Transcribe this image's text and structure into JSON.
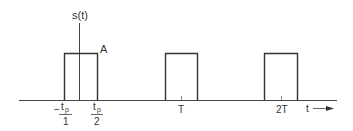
{
  "diagram": {
    "y_axis_label": "s(t)",
    "amplitude_label": "A",
    "x_axis_label": "t",
    "tick_labels": {
      "neg_half_width_num": "t",
      "neg_half_width_sub": "p",
      "neg_half_width_den": "1",
      "neg_sign": "−",
      "pos_half_width_num": "t",
      "pos_half_width_sub": "p",
      "pos_half_width_den": "2",
      "period": "T",
      "two_period": "2T"
    },
    "pulses": [
      {
        "center": "0",
        "label": "pulse-0"
      },
      {
        "center": "T",
        "label": "pulse-T"
      },
      {
        "center": "2T",
        "label": "pulse-2T"
      }
    ],
    "line_color": "#333333"
  }
}
